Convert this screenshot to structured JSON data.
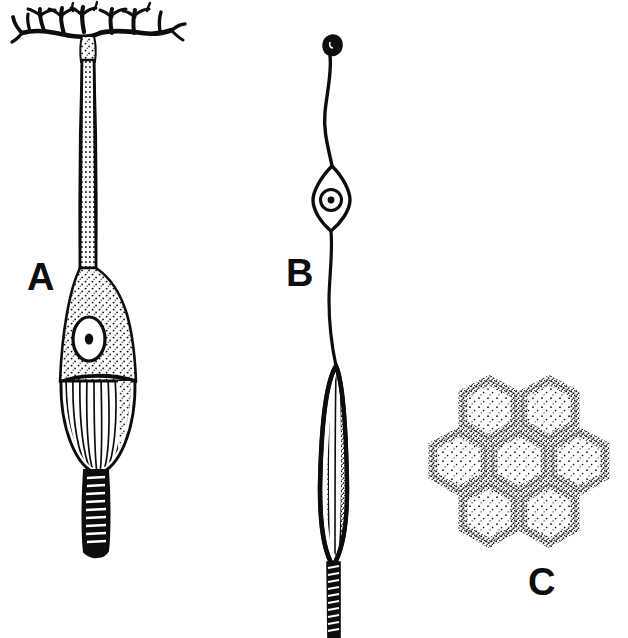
{
  "figure": {
    "background_color": "#ffffff",
    "ink_color": "#0d0d0d",
    "width": 628,
    "height": 638,
    "cropped_caption": "",
    "panels": [
      {
        "id": "A",
        "label": "A",
        "name": "branched-sensory-cell",
        "description": "Elongated sensory cell with branching dendritic tuft at top, long slender stippled stalk, bulbous stippled cell body containing a round nucleus with central nucleolus, a striated (ribbed) basal region, and a short banded terminal tail.",
        "label_x": 27,
        "label_y": 258,
        "parts": [
          "dendritic-tuft",
          "slender-stalk",
          "cell-body",
          "nucleus",
          "nucleolus",
          "striated-basal-region",
          "banded-tail"
        ]
      },
      {
        "id": "B",
        "label": "B",
        "name": "bipolar-spindle-cell",
        "description": "Bipolar cell with a small dark terminal knob at the apex, a wavy slender fiber, a lens-shaped (fusiform) cell body containing a nucleus with nucleolus, and a long striated spindle-shaped basal body continuing into a banded fiber running off the bottom edge.",
        "label_x": 286,
        "label_y": 254,
        "parts": [
          "apical-knob",
          "wavy-fiber",
          "spindle-cell-body",
          "nucleus",
          "nucleolus",
          "striated-rod",
          "banded-fiber"
        ]
      },
      {
        "id": "C",
        "label": "C",
        "name": "hexagonal-cell-mosaic",
        "description": "Surface view of a honeycomb mosaic: seven stippled hexagonal cells, one central hexagon surrounded by six neighbours, each outlined with a granular stippled border.",
        "label_x": 528,
        "label_y": 563,
        "hexagon_count": 7,
        "arrangement": "one-centre-six-surrounding",
        "parts": [
          "central-hexagon",
          "surrounding-hexagon"
        ]
      }
    ]
  }
}
